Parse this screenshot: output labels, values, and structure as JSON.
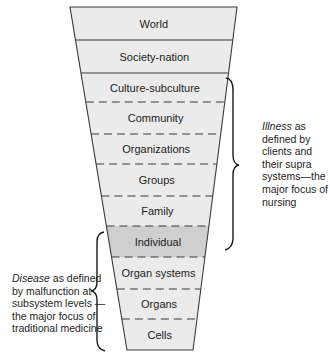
{
  "diagram": {
    "type": "funnel-hierarchy",
    "levels": [
      {
        "label": "World",
        "shaded": false,
        "divider_below": "solid"
      },
      {
        "label": "Society-nation",
        "shaded": false,
        "divider_below": "solid"
      },
      {
        "label": "Culture-subculture",
        "shaded": false,
        "divider_below": "dashed"
      },
      {
        "label": "Community",
        "shaded": false,
        "divider_below": "dashed"
      },
      {
        "label": "Organizations",
        "shaded": false,
        "divider_below": "dashed"
      },
      {
        "label": "Groups",
        "shaded": false,
        "divider_below": "dashed"
      },
      {
        "label": "Family",
        "shaded": false,
        "divider_below": "dashed"
      },
      {
        "label": "Individual",
        "shaded": true,
        "divider_below": "dashed"
      },
      {
        "label": "Organ systems",
        "shaded": false,
        "divider_below": "dashed"
      },
      {
        "label": "Organs",
        "shaded": false,
        "divider_below": "dashed"
      },
      {
        "label": "Cells",
        "shaded": false,
        "divider_below": "none"
      }
    ],
    "boundaries_y": [
      7,
      40,
      73,
      102,
      134,
      164,
      196,
      226,
      257,
      289,
      319,
      350
    ],
    "colors": {
      "row_fill": "#ebebeb",
      "shaded_fill": "#cfcfcf",
      "outline": "#3a3a3a",
      "background": "#ffffff"
    }
  },
  "annotations": {
    "illness": {
      "emphasis": "Illness",
      "text": " as defined by clients and their supra systems—the major focus of nursing",
      "bracket_spans": [
        "Culture-subculture",
        "Family"
      ]
    },
    "disease": {
      "emphasis": "Disease",
      "text": " as defined by malfunction at subsystem levels —the major focus of traditional medicine",
      "bracket_spans": [
        "Individual",
        "Cells"
      ]
    }
  }
}
